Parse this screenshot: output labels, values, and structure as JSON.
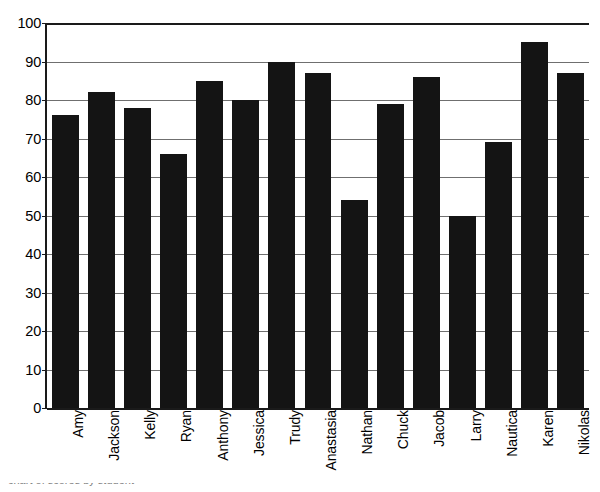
{
  "chart_data": {
    "type": "bar",
    "title": "",
    "subtitle": "",
    "xlabel": "",
    "ylabel": "",
    "categories": [
      "Amy",
      "Jackson",
      "Kelly",
      "Ryan",
      "Anthony",
      "Jessica",
      "Trudy",
      "Anastasia",
      "Nathan",
      "Chuck",
      "Jacob",
      "Larry",
      "Nautica",
      "Karen",
      "Nikolas"
    ],
    "values": [
      76,
      82,
      78,
      66,
      85,
      80,
      90,
      87,
      54,
      79,
      86,
      50,
      69,
      95,
      87
    ],
    "ylim": [
      0,
      100
    ],
    "yticks": [
      0,
      10,
      20,
      30,
      40,
      50,
      60,
      70,
      80,
      90,
      100
    ],
    "ytick_labels": [
      "0",
      "10",
      "20",
      "30",
      "40",
      "50",
      "60",
      "70",
      "80",
      "90",
      "100"
    ],
    "grid": true,
    "grid_axis": "y",
    "legend": false,
    "legend_position": "none",
    "bar_color": "#141414",
    "grid_color": "#6f6f6f",
    "axis_color": "#1a1a1a",
    "background_color": "#ffffff",
    "xtick_rotation": -90
  },
  "caption": {
    "text": "chart of scores by student"
  }
}
